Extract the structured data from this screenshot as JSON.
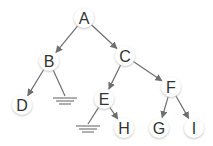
{
  "diagram": {
    "type": "binary-tree",
    "colors": {
      "edge": "#6e6e6e",
      "node_fill": "#ffffff",
      "node_shadow": "#d8d8d8",
      "text": "#333333"
    },
    "nodes": [
      {
        "id": "A",
        "label": "A",
        "x": 84,
        "y": 18
      },
      {
        "id": "B",
        "label": "B",
        "x": 49,
        "y": 61
      },
      {
        "id": "C",
        "label": "C",
        "x": 125,
        "y": 56
      },
      {
        "id": "D",
        "label": "D",
        "x": 22,
        "y": 105
      },
      {
        "id": "E",
        "label": "E",
        "x": 104,
        "y": 99
      },
      {
        "id": "F",
        "label": "F",
        "x": 171,
        "y": 87
      },
      {
        "id": "H",
        "label": "H",
        "x": 124,
        "y": 128
      },
      {
        "id": "G",
        "label": "G",
        "x": 159,
        "y": 128
      },
      {
        "id": "I",
        "label": "I",
        "x": 194,
        "y": 128
      }
    ],
    "edges": [
      {
        "from": "A",
        "to": "B",
        "arrow": true
      },
      {
        "from": "A",
        "to": "C",
        "arrow": true
      },
      {
        "from": "B",
        "to": "D",
        "arrow": true
      },
      {
        "from": "B",
        "to": "null",
        "arrow": false
      },
      {
        "from": "C",
        "to": "E",
        "arrow": true
      },
      {
        "from": "C",
        "to": "F",
        "arrow": true
      },
      {
        "from": "E",
        "to": "null",
        "arrow": false
      },
      {
        "from": "E",
        "to": "H",
        "arrow": true
      },
      {
        "from": "F",
        "to": "G",
        "arrow": true
      },
      {
        "from": "F",
        "to": "I",
        "arrow": true
      }
    ],
    "null_markers": [
      {
        "parent": "B",
        "x": 65,
        "y": 98
      },
      {
        "parent": "E",
        "x": 88,
        "y": 126
      }
    ]
  }
}
